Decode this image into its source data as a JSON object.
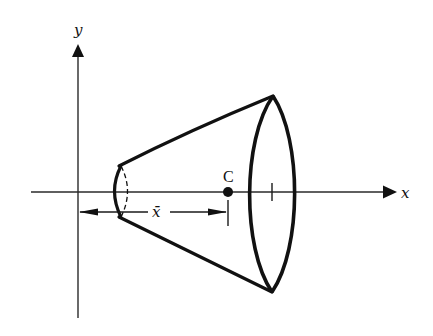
{
  "figure": {
    "axes": {
      "x_label": "x",
      "y_label": "y"
    },
    "centroid": {
      "label": "C"
    },
    "dimension": {
      "label": "x̄"
    },
    "colors": {
      "ink": "#111111",
      "background": "#ffffff"
    }
  }
}
